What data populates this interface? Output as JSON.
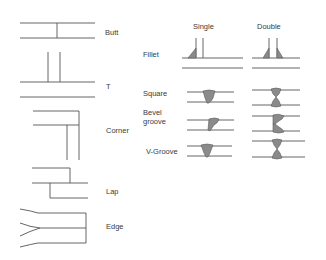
{
  "joints": [
    {
      "id": "butt",
      "label": "Butt"
    },
    {
      "id": "t",
      "label": "T"
    },
    {
      "id": "corner",
      "label": "Corner"
    },
    {
      "id": "lap",
      "label": "Lap"
    },
    {
      "id": "edge",
      "label": "Edge"
    }
  ],
  "weld_table": {
    "columns": [
      "Single",
      "Double"
    ],
    "rows": [
      {
        "id": "fillet",
        "label": "Fillet"
      },
      {
        "id": "square",
        "label": "Square"
      },
      {
        "id": "bevel",
        "label_line1": "Bevel",
        "label_line2": "groove"
      },
      {
        "id": "vgroove",
        "label": "V-Groove"
      }
    ]
  },
  "colors": {
    "line": "#555555",
    "weld_fill": "#8a8a8a",
    "text": "#3a3a3a"
  }
}
